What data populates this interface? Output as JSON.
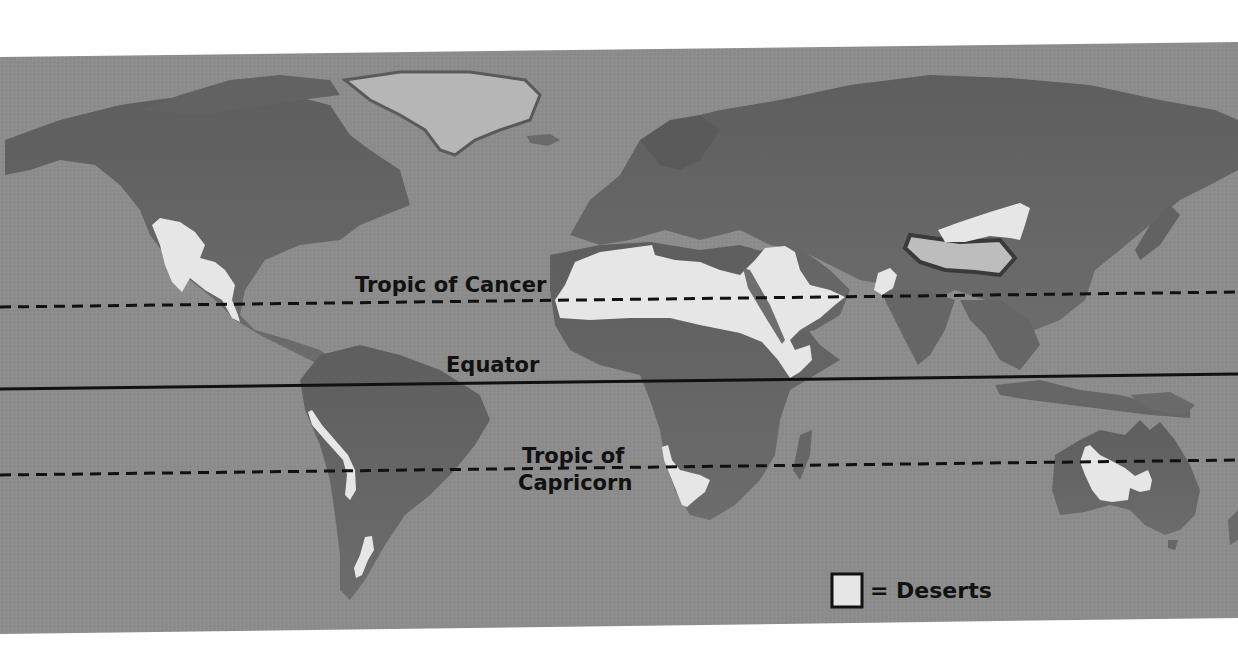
{
  "map": {
    "title": "World Deserts",
    "colors": {
      "ocean": "#8c8c8c",
      "land": "#6e6e6e",
      "land_dark": "#585858",
      "land_light": "#9a9a9a",
      "ice": "#c8c8c8",
      "desert": "#e6e6e6",
      "line": "#111111",
      "page_background": "#ffffff"
    },
    "lines": [
      {
        "name": "Tropic of Cancer",
        "style": "dashed",
        "y_left": 307,
        "y_right": 292
      },
      {
        "name": "Equator",
        "style": "solid",
        "y_left": 389,
        "y_right": 374
      },
      {
        "name": "Tropic of Capricorn",
        "style": "dashed",
        "y_left": 475,
        "y_right": 460
      }
    ],
    "labels": {
      "tropic_of_cancer": "Tropic of Cancer",
      "equator": "Equator",
      "tropic_of_capricorn_line1": "Tropic of",
      "tropic_of_capricorn_line2": "Capricorn"
    },
    "deserts": [
      "North American deserts (Sonoran / Chihuahuan)",
      "Atacama (South America west coast)",
      "Patagonian",
      "Sahara",
      "Arabian",
      "Thar",
      "Gobi",
      "Taklamakan / Tibetan plateau",
      "Namib / Kalahari",
      "Australian deserts"
    ],
    "legend": {
      "symbol": "desert-swatch",
      "text": "= Deserts"
    }
  }
}
